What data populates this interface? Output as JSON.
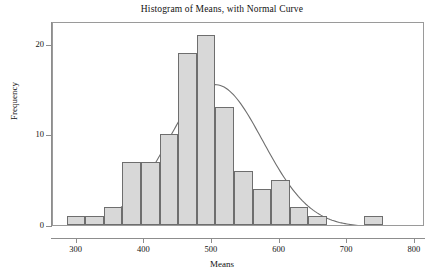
{
  "chart_data": {
    "type": "bar",
    "title": "Histogram of Means, with Normal Curve",
    "xlabel": "Means",
    "ylabel": "Frequency",
    "xlim": [
      265,
      815
    ],
    "ylim": [
      0,
      22.5
    ],
    "xticks": [
      300,
      400,
      500,
      600,
      700,
      800
    ],
    "yticks": [
      0,
      10,
      20
    ],
    "grid": false,
    "legend": null,
    "bin_width": 27.5,
    "bin_edges": [
      285,
      312.5,
      340,
      367.5,
      395,
      422.5,
      450,
      477.5,
      505,
      532.5,
      560,
      587.5,
      615,
      642.5,
      670,
      697.5,
      725,
      752.5,
      780
    ],
    "bin_centers": [
      298.75,
      326.25,
      353.75,
      381.25,
      408.75,
      436.25,
      463.75,
      491.25,
      518.75,
      546.25,
      573.75,
      601.25,
      628.75,
      656.25,
      683.75,
      711.25,
      738.75,
      766.25
    ],
    "values": [
      1,
      1,
      2,
      7,
      7,
      10,
      19,
      21,
      13,
      6,
      4,
      5,
      2,
      1,
      0,
      0,
      1,
      0
    ],
    "categories": [
      "285-312",
      "312-340",
      "340-368",
      "368-395",
      "395-422",
      "422-450",
      "450-478",
      "478-505",
      "505-532",
      "532-560",
      "560-588",
      "588-615",
      "615-642",
      "642-670",
      "670-698",
      "698-725",
      "725-752",
      "752-780"
    ],
    "overlay": {
      "type": "line",
      "name": "Normal Curve",
      "mean": 505,
      "sd": 70,
      "peak_frequency": 15.7,
      "color": "#6e6e6e"
    }
  },
  "axes": {
    "y_tick_labels": [
      "0",
      "10",
      "20"
    ],
    "x_tick_labels": [
      "300",
      "400",
      "500",
      "600",
      "700",
      "800"
    ]
  },
  "colors": {
    "bar_fill": "#d8d8d8",
    "bar_border": "#6e6e6e",
    "curve": "#6e6e6e",
    "axis": "#8d8d8d",
    "text": "#111111"
  }
}
